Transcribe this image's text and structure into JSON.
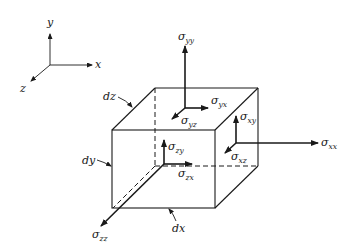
{
  "figure": {
    "type": "stress-element-diagram",
    "axes": {
      "x_label": "x",
      "y_label": "y",
      "z_label": "z"
    },
    "dimensions": {
      "dx": "dx",
      "dy": "dy",
      "dz": "dz"
    },
    "stresses": {
      "yy": {
        "sym": "σ",
        "sub": "yy"
      },
      "yx": {
        "sym": "σ",
        "sub": "yx"
      },
      "yz": {
        "sym": "σ",
        "sub": "yz"
      },
      "xy": {
        "sym": "σ",
        "sub": "xy"
      },
      "xx": {
        "sym": "σ",
        "sub": "xx"
      },
      "xz": {
        "sym": "σ",
        "sub": "xz"
      },
      "zy": {
        "sym": "σ",
        "sub": "zy"
      },
      "zx": {
        "sym": "σ",
        "sub": "zx"
      },
      "zz": {
        "sym": "σ",
        "sub": "zz"
      }
    },
    "colors": {
      "ink": "#1a1a1a",
      "background": "#ffffff"
    }
  }
}
